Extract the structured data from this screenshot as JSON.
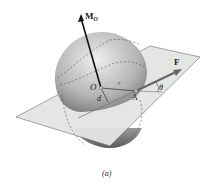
{
  "figure": {
    "caption": "(a)",
    "labels": {
      "moment": "M",
      "moment_subscript": "O",
      "force": "F",
      "origin": "O",
      "point": "A",
      "distance": "d",
      "position": "r",
      "angle": "θ"
    },
    "colors": {
      "plane": "#e4e6e4",
      "plane_edge": "#555555",
      "sphere_light": "#e6e6e6",
      "sphere_dark": "#7a7a7a",
      "vector": "#1a1a1a",
      "force_vector": "#666666"
    }
  }
}
